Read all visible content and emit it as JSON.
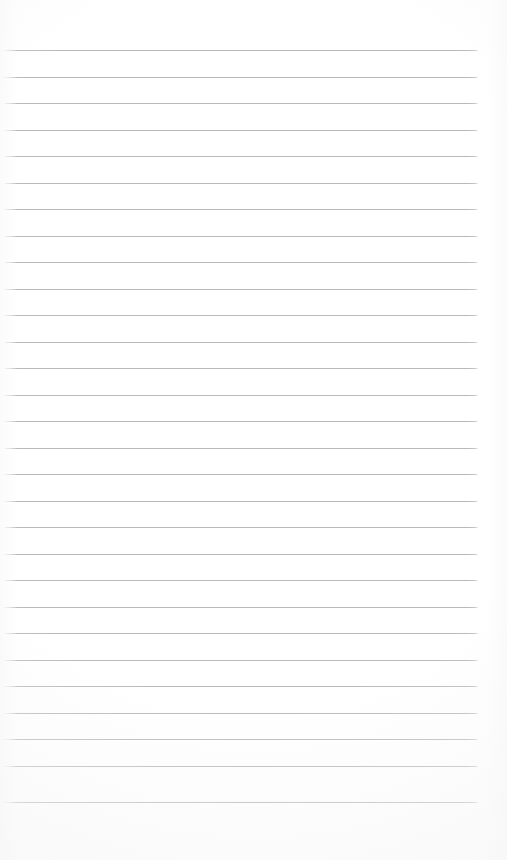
{
  "document": {
    "kind": "ruled-notebook-page",
    "description": "Blank lined writing paper, no handwriting or printed text present",
    "width": 507,
    "height": 860,
    "background_color": "#ffffff",
    "content_text": ""
  },
  "ruling": {
    "line_color": "#b6b6bb",
    "line_thickness_px": 1,
    "line_count": 29,
    "line_spacing_px": 26.5,
    "first_line_y": 50,
    "last_line_y": 802,
    "line_start_x": 3,
    "line_end_x": 478,
    "top_margin_px": 50,
    "bottom_margin_px": 58,
    "right_margin_px": 29,
    "left_margin_px": 3,
    "has_vertical_margin_rule": false,
    "line_y_positions": [
      50,
      76.5,
      103,
      129.5,
      156,
      182.5,
      209,
      235.5,
      262,
      288.5,
      315,
      341.5,
      368,
      394.5,
      421,
      447.5,
      474,
      500.5,
      527,
      553.5,
      580,
      606.5,
      633,
      659.5,
      686,
      712.5,
      739,
      765.5,
      802
    ]
  },
  "writing_lines": [
    {
      "index": 1,
      "text": ""
    },
    {
      "index": 2,
      "text": ""
    },
    {
      "index": 3,
      "text": ""
    },
    {
      "index": 4,
      "text": ""
    },
    {
      "index": 5,
      "text": ""
    },
    {
      "index": 6,
      "text": ""
    },
    {
      "index": 7,
      "text": ""
    },
    {
      "index": 8,
      "text": ""
    },
    {
      "index": 9,
      "text": ""
    },
    {
      "index": 10,
      "text": ""
    },
    {
      "index": 11,
      "text": ""
    },
    {
      "index": 12,
      "text": ""
    },
    {
      "index": 13,
      "text": ""
    },
    {
      "index": 14,
      "text": ""
    },
    {
      "index": 15,
      "text": ""
    },
    {
      "index": 16,
      "text": ""
    },
    {
      "index": 17,
      "text": ""
    },
    {
      "index": 18,
      "text": ""
    },
    {
      "index": 19,
      "text": ""
    },
    {
      "index": 20,
      "text": ""
    },
    {
      "index": 21,
      "text": ""
    },
    {
      "index": 22,
      "text": ""
    },
    {
      "index": 23,
      "text": ""
    },
    {
      "index": 24,
      "text": ""
    },
    {
      "index": 25,
      "text": ""
    },
    {
      "index": 26,
      "text": ""
    },
    {
      "index": 27,
      "text": ""
    },
    {
      "index": 28,
      "text": ""
    },
    {
      "index": 29,
      "text": ""
    }
  ]
}
